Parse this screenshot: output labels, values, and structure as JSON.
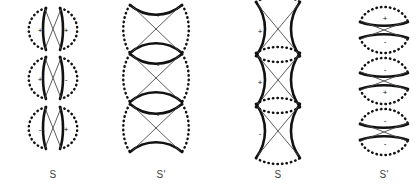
{
  "figure": {
    "background_color": "#ffffff",
    "stroke_color": "#111111",
    "thin_line_color": "#4a4a4a",
    "columns": [
      {
        "label": "S",
        "label_x": 53,
        "center_x": 53,
        "style": "horizontal-lens-pair",
        "rows": [
          {
            "center_y": 29,
            "signs": [
              {
                "text": "+",
                "dx": -13,
                "dy": 2
              },
              {
                "text": "+",
                "dx": 13,
                "dy": 2
              }
            ]
          },
          {
            "center_y": 78,
            "signs": [
              {
                "text": "+",
                "dx": -13,
                "dy": 2
              },
              {
                "text": "-",
                "dx": 13,
                "dy": 2
              }
            ]
          },
          {
            "center_y": 128,
            "signs": [
              {
                "text": "-",
                "dx": -13,
                "dy": 2
              },
              {
                "text": "+",
                "dx": 13,
                "dy": 2
              }
            ]
          }
        ]
      },
      {
        "label": "S'",
        "label_x": 161,
        "center_x": 156,
        "style": "hourglass-horizontal",
        "rows": [
          {
            "center_y": 29,
            "signs": [
              {
                "text": "+",
                "dx": 2,
                "dy": -13
              }
            ]
          },
          {
            "center_y": 78,
            "signs": [
              {
                "text": "-",
                "dx": 2,
                "dy": -13
              }
            ]
          },
          {
            "center_y": 128,
            "signs": [
              {
                "text": "-",
                "dx": 2,
                "dy": -13
              }
            ]
          }
        ]
      },
      {
        "label": "S",
        "label_x": 278,
        "center_x": 278,
        "style": "hourglass-vertical",
        "rows": [
          {
            "center_y": 29,
            "signs": [
              {
                "text": "+",
                "dx": -18,
                "dy": 3
              }
            ]
          },
          {
            "center_y": 80,
            "signs": [
              {
                "text": "+",
                "dx": -18,
                "dy": 3
              }
            ]
          },
          {
            "center_y": 131,
            "signs": [
              {
                "text": "-",
                "dx": -18,
                "dy": 3
              }
            ]
          }
        ]
      },
      {
        "label": "S'",
        "label_x": 384,
        "center_x": 384,
        "style": "vertical-lens-pair",
        "rows": [
          {
            "center_y": 30,
            "signs": [
              {
                "text": "+",
                "dx": 1,
                "dy": -11
              },
              {
                "text": "-",
                "dx": 1,
                "dy": 12
              }
            ]
          },
          {
            "center_y": 81,
            "signs": [
              {
                "text": "-",
                "dx": 1,
                "dy": -11
              },
              {
                "text": "+",
                "dx": 1,
                "dy": 12
              }
            ]
          },
          {
            "center_y": 132,
            "signs": [
              {
                "text": "-",
                "dx": 1,
                "dy": -11
              },
              {
                "text": "-",
                "dx": 1,
                "dy": 12
              }
            ]
          }
        ]
      }
    ],
    "label_y": 178
  }
}
